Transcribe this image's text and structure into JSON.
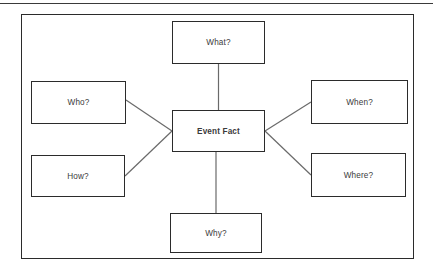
{
  "diagram": {
    "center": {
      "id": "event-fact",
      "label": "Event Fact"
    },
    "nodes": [
      {
        "id": "what",
        "label": "What?"
      },
      {
        "id": "who",
        "label": "Who?"
      },
      {
        "id": "when",
        "label": "When?"
      },
      {
        "id": "how",
        "label": "How?"
      },
      {
        "id": "where",
        "label": "Where?"
      },
      {
        "id": "why",
        "label": "Why?"
      }
    ],
    "connections": [
      {
        "from": "what",
        "to": "event-fact",
        "style": "vertical"
      },
      {
        "from": "who",
        "to": "event-fact",
        "style": "diagonal"
      },
      {
        "from": "how",
        "to": "event-fact",
        "style": "diagonal"
      },
      {
        "from": "when",
        "to": "event-fact",
        "style": "diagonal"
      },
      {
        "from": "where",
        "to": "event-fact",
        "style": "diagonal"
      },
      {
        "from": "why",
        "to": "event-fact",
        "style": "vertical"
      }
    ],
    "colors": {
      "box_border": "#2b2b2b",
      "connector": "#6a6a6a",
      "text": "#3b3b3b",
      "background": "#ffffff",
      "rule": "#3a3a3a"
    }
  }
}
